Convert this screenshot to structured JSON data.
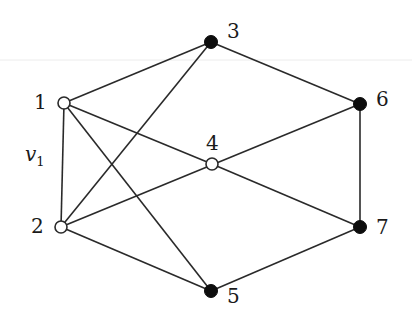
{
  "diagram": {
    "type": "graph",
    "nodes": [
      {
        "id": "1",
        "label": "1",
        "x": 64,
        "y": 103,
        "style": "open",
        "label_dx": -30,
        "label_dy": 6
      },
      {
        "id": "2",
        "label": "2",
        "x": 61,
        "y": 227,
        "style": "open",
        "label_dx": -30,
        "label_dy": 6
      },
      {
        "id": "3",
        "label": "3",
        "x": 211,
        "y": 42,
        "style": "filled",
        "label_dx": 16,
        "label_dy": -4
      },
      {
        "id": "4",
        "label": "4",
        "x": 212,
        "y": 164,
        "style": "open",
        "label_dx": -6,
        "label_dy": -14
      },
      {
        "id": "5",
        "label": "5",
        "x": 211,
        "y": 291,
        "style": "filled",
        "label_dx": 16,
        "label_dy": 12
      },
      {
        "id": "6",
        "label": "6",
        "x": 360,
        "y": 104,
        "style": "filled",
        "label_dx": 16,
        "label_dy": 2
      },
      {
        "id": "7",
        "label": "7",
        "x": 360,
        "y": 227,
        "style": "filled",
        "label_dx": 16,
        "label_dy": 7
      }
    ],
    "edges": [
      [
        "1",
        "3"
      ],
      [
        "1",
        "2"
      ],
      [
        "1",
        "4"
      ],
      [
        "1",
        "5"
      ],
      [
        "2",
        "3"
      ],
      [
        "2",
        "6"
      ],
      [
        "2",
        "5"
      ],
      [
        "3",
        "6"
      ],
      [
        "4",
        "7"
      ],
      [
        "6",
        "7"
      ],
      [
        "5",
        "7"
      ]
    ],
    "annotations": [
      {
        "text": "v",
        "subscript": "1",
        "x": 25,
        "y": 161
      }
    ],
    "colors": {
      "edge": "#2a2a2a",
      "filled_node": "#0d0d0d",
      "open_node_fill": "#ffffff"
    }
  }
}
